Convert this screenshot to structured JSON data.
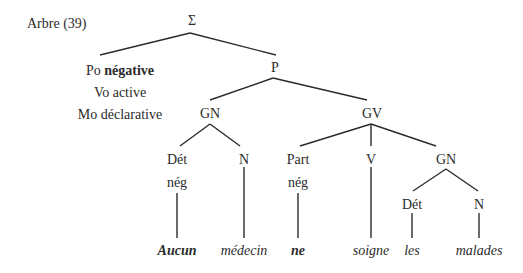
{
  "title": "Arbre (39)",
  "nodes": {
    "sigma": "Σ",
    "p": "P",
    "gn1": "GN",
    "gv": "GV",
    "det1": "Dét",
    "det1_sub": "nég",
    "n1": "N",
    "part": "Part",
    "part_sub": "nég",
    "v": "V",
    "gn2": "GN",
    "det2": "Dét",
    "n2": "N"
  },
  "features": {
    "po_label": "Po",
    "po_value": "négative",
    "vo": "Vo active",
    "mo": "Mo déclarative"
  },
  "words": {
    "aucun": "Aucun",
    "medecin": "médecin",
    "ne": "ne",
    "soigne": "soigne",
    "les": "les",
    "malades": "malades"
  },
  "colors": {
    "ink": "#2b2b2b"
  }
}
